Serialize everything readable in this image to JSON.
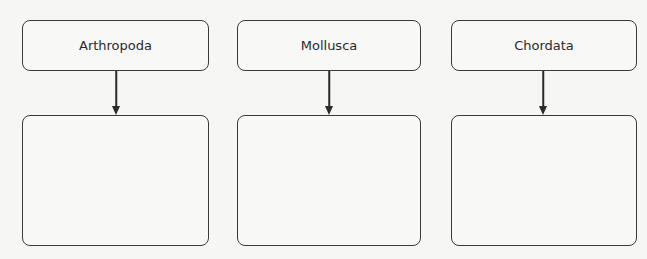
{
  "diagram": {
    "type": "flowchart",
    "columns": [
      {
        "label": "Arthropoda",
        "child_text": ""
      },
      {
        "label": "Mollusca",
        "child_text": ""
      },
      {
        "label": "Chordata",
        "child_text": ""
      }
    ],
    "colors": {
      "background": "#f6f6f4",
      "stroke": "#3a3a3a",
      "text": "#2a2a2a"
    }
  }
}
